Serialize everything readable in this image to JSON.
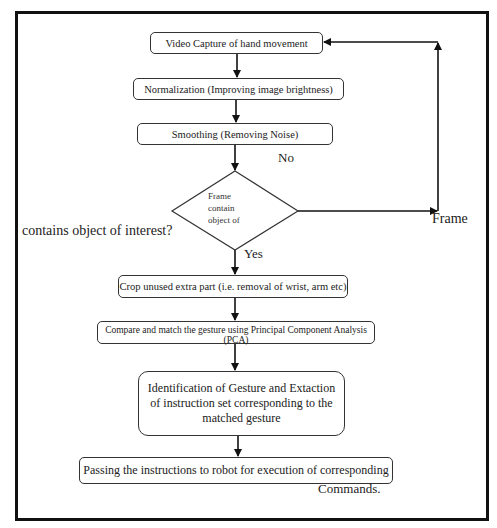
{
  "diagram": {
    "type": "flowchart",
    "nodes": [
      {
        "id": "n1",
        "shape": "rounded-rect",
        "label": "Video Capture of hand movement"
      },
      {
        "id": "n2",
        "shape": "rounded-rect",
        "label": "Normalization (Improving image brightness)"
      },
      {
        "id": "n3",
        "shape": "rounded-rect",
        "label": "Smoothing (Removing Noise)"
      },
      {
        "id": "n4",
        "shape": "diamond",
        "label_lines": [
          "Frame",
          "contain",
          "object of"
        ]
      },
      {
        "id": "n5",
        "shape": "rounded-rect",
        "label": "Crop unused extra part (i.e. removal of wrist, arm etc)"
      },
      {
        "id": "n6",
        "shape": "rounded-rect",
        "label_lines": [
          "Compare and match the gesture using Principal Component Analysis",
          "(PCA)"
        ]
      },
      {
        "id": "n7",
        "shape": "rounded-rect",
        "label_lines": [
          "Identification of Gesture and Extaction",
          "of instruction set corresponding to the",
          "matched gesture"
        ]
      },
      {
        "id": "n8",
        "shape": "rounded-rect",
        "label": "Passing the instructions to robot for execution of corresponding"
      }
    ],
    "edges": [
      {
        "from": "n1",
        "to": "n2"
      },
      {
        "from": "n2",
        "to": "n3"
      },
      {
        "from": "n3",
        "to": "n4"
      },
      {
        "from": "n4",
        "to": "n5",
        "label": "Yes"
      },
      {
        "from": "n4",
        "to": "n1",
        "label": "No"
      },
      {
        "from": "n5",
        "to": "n6"
      },
      {
        "from": "n6",
        "to": "n7"
      },
      {
        "from": "n7",
        "to": "n8"
      }
    ],
    "labels": {
      "no": "No",
      "yes": "Yes",
      "frame_overflow": "Frame",
      "question_overflow": "contains object of interest?",
      "commands_overflow": "Commands."
    }
  }
}
